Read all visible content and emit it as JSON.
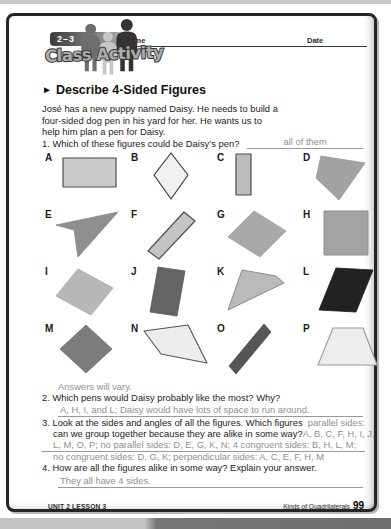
{
  "header": {
    "lesson_badge": "2–3",
    "logo_title": "Class Activity",
    "name_label": "Name",
    "date_label": "Date"
  },
  "icons": {
    "section_arrow": "►"
  },
  "section": {
    "title": "Describe 4-Sided Figures"
  },
  "intro": {
    "line1": "José has a new puppy named Daisy. He needs to build a",
    "line2": "four-sided dog pen in his yard for her. He wants us to",
    "line3": "help him plan a pen for Daisy."
  },
  "questions": {
    "q1": {
      "number": "1.",
      "text": "Which of these figures could be Daisy’s pen?",
      "answer": "all of them"
    },
    "q2": {
      "number": "2.",
      "text": "Which pens would Daisy probably like the most? Why?",
      "answer": "A, H, I, and L; Daisy would have lots of space to run around."
    },
    "q3": {
      "number": "3.",
      "text_line1": "Look at the sides and angles of all the figures. Which figures",
      "answer_line1": "parallel  sides:",
      "text_line2": "can we group together because they are alike in some way?",
      "answer_line2": "A, B, C, F, H, I, J,",
      "answer_line3": "L, M, O, P; no parallel sides: D, E, G, K, N; 4 congruent sides: B, H, L, M;",
      "answer_line4": "no congruent sides: D, G, K; perpendicular sides: A, C, E, F, H, M"
    },
    "q4": {
      "number": "4.",
      "text": "How are all the figures alike in some way? Explain your answer.",
      "answer": "They all have 4 sides."
    }
  },
  "answers_note": "Answers will vary.",
  "figures": [
    {
      "label": "A",
      "points": "8,6 61,6 61,35 8,35",
      "fill": "#c9c9c9",
      "stroke": "#4f4f4f",
      "stroke_width": 1.2
    },
    {
      "label": "B",
      "points": "30,1 47,23 30,47 13,23",
      "fill": "#f1f1f1",
      "stroke": "#3a3a3a",
      "stroke_width": 1.2
    },
    {
      "label": "C",
      "points": "9,2 24,2 24,43 9,43",
      "fill": "#bcbcbc",
      "stroke": "#4f4f4f",
      "stroke_width": 1.2
    },
    {
      "label": "D",
      "points": "8,4 52,11 26,48 3,26",
      "fill": "#a2a2a2",
      "stroke": "#969696",
      "stroke_width": 0.8
    },
    {
      "label": "E",
      "points": "1,16 63,3 23,48 19,21",
      "fill": "#8f8f8f",
      "stroke": "#858585",
      "stroke_width": 0.8
    },
    {
      "label": "F",
      "points": "7,42 43,3 54,12 18,50",
      "fill": "#c4c4c4",
      "stroke": "#4f4f4f",
      "stroke_width": 1.2
    },
    {
      "label": "G",
      "points": "27,2 59,22 33,48 1,28",
      "fill": "#a9a9a9",
      "stroke": "#9a9a9a",
      "stroke_width": 0.8
    },
    {
      "label": "H",
      "points": "11,2 55,2 55,46 11,46",
      "fill": "#a3a3a3",
      "stroke": "#8e8e8e",
      "stroke_width": 1.0
    },
    {
      "label": "I",
      "points": "23,3 58,22 36,49 1,30",
      "fill": "#b7b7b7",
      "stroke": "#a5a5a5",
      "stroke_width": 0.8
    },
    {
      "label": "J",
      "points": "17,1 44,5 36,50 9,46",
      "fill": "#646464",
      "stroke": "#5a5a5a",
      "stroke_width": 0.8
    },
    {
      "label": "K",
      "points": "15,4 49,10 57,17 1,44",
      "fill": "#bababa",
      "stroke": "#8a8a8a",
      "stroke_width": 1.0
    },
    {
      "label": "L",
      "points": "23,2 60,4 43,46 6,44",
      "fill": "#222222",
      "stroke": "#1a1a1a",
      "stroke_width": 0.8
    },
    {
      "label": "M",
      "points": "31,2 57,26 31,50 5,26",
      "fill": "#7c7c7c",
      "stroke": "#707070",
      "stroke_width": 0.8
    },
    {
      "label": "N",
      "points": "3,8 47,2 66,40 20,31",
      "fill": "#ececec",
      "stroke": "#555555",
      "stroke_width": 1.1
    },
    {
      "label": "O",
      "points": "37,1 44,9 9,51 2,43",
      "fill": "#565656",
      "stroke": "#4a4a4a",
      "stroke_width": 0.8
    },
    {
      "label": "P",
      "points": "20,5 50,5 64,42 5,42",
      "fill": "#ededed",
      "stroke": "#999999",
      "stroke_width": 1.1
    }
  ],
  "footer": {
    "left": "UNIT 2 LESSON 3",
    "right_text": "Kinds of Quadrilaterals",
    "page_number": "99"
  },
  "colors": {
    "page_border": "#262626",
    "answer_gray": "#8f8f8f",
    "badge_dark": "#3c3c3c"
  }
}
